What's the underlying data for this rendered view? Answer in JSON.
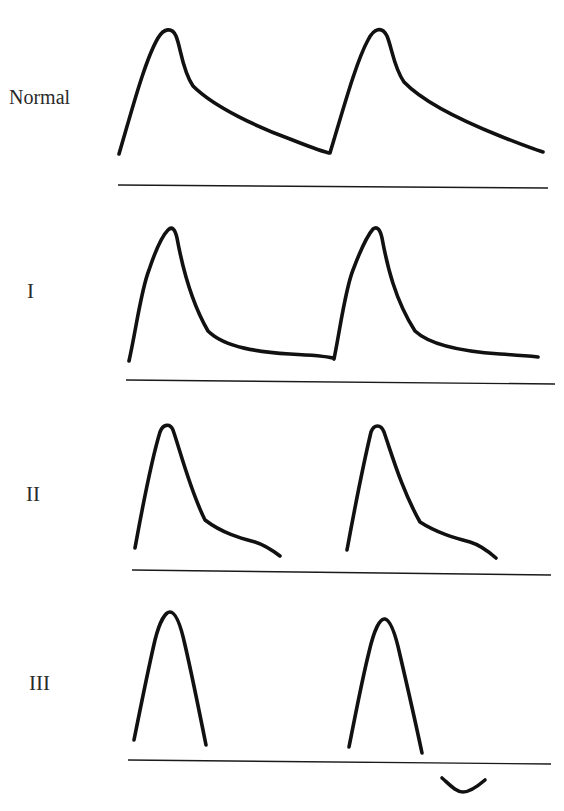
{
  "figure": {
    "panels": [
      {
        "id": "normal",
        "label": "Normal"
      },
      {
        "id": "grade-1",
        "label": "I"
      },
      {
        "id": "grade-2",
        "label": "II"
      },
      {
        "id": "grade-3",
        "label": "III"
      }
    ]
  },
  "colors": {
    "trace": "#111111",
    "baseline": "#1a1a1a",
    "label": "#2a2a2a",
    "background": "#ffffff"
  }
}
